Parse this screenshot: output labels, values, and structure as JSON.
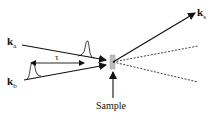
{
  "diagram": {
    "labels": {
      "ka": {
        "main": "k",
        "sub": "a"
      },
      "kb": {
        "main": "k",
        "sub": "b"
      },
      "ks": {
        "main": "k",
        "sub": "s"
      },
      "tau": "τ",
      "sample": "Sample"
    },
    "colors": {
      "line": "#111111",
      "sample_fill": "#bdbdbd",
      "background": "#ffffff"
    },
    "elements": [
      "incident beam k_a with pulse",
      "incident beam k_b with pulse",
      "delay tau double arrow between pulses",
      "sample (gray rectangle)",
      "scattered beam k_s",
      "two dotted transmitted beams",
      "arrow pointing to sample"
    ]
  }
}
